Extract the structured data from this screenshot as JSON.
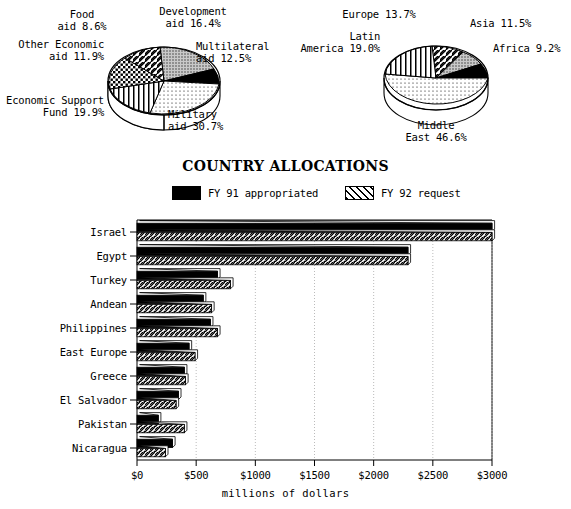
{
  "chart_data": [
    {
      "type": "pie",
      "id": "aid-by-category",
      "title": "",
      "labels": [
        "Development aid",
        "Multilateral aid",
        "Military aid",
        "Economic Support Fund",
        "Other Economic aid",
        "Food aid"
      ],
      "values": [
        16.4,
        12.5,
        30.7,
        19.9,
        11.9,
        8.6
      ],
      "value_suffix": "%",
      "patterns": [
        "gray-dots",
        "black",
        "light-dots",
        "vertical-lines",
        "checker",
        "diagonal"
      ],
      "annotations": [
        {
          "text": "Development\naid 16.4%"
        },
        {
          "text": "Multilateral\naid 12.5%"
        },
        {
          "text": "Military\naid 30.7%"
        },
        {
          "text": "Economic Support\nFund 19.9%"
        },
        {
          "text": "Other Economic\naid 11.9%"
        },
        {
          "text": "Food\naid 8.6%"
        }
      ]
    },
    {
      "type": "pie",
      "id": "aid-by-region",
      "title": "",
      "labels": [
        "Europe",
        "Asia",
        "Africa",
        "Middle East",
        "Latin America"
      ],
      "values": [
        13.7,
        11.5,
        9.2,
        46.6,
        19.0
      ],
      "value_suffix": "%",
      "patterns": [
        "diagonal",
        "gray-dots",
        "black",
        "light-dots",
        "vertical-lines"
      ],
      "annotations": [
        {
          "text": "Europe 13.7%"
        },
        {
          "text": "Asia 11.5%"
        },
        {
          "text": "Africa 9.2%"
        },
        {
          "text": "Middle\nEast 46.6%"
        },
        {
          "text": "Latin\nAmerica 19.0%"
        }
      ]
    },
    {
      "type": "bar",
      "id": "country-allocations",
      "orientation": "horizontal",
      "title": "COUNTRY ALLOCATIONS",
      "xlabel": "millions of dollars",
      "ylabel": "",
      "xlim": [
        0,
        3000
      ],
      "xticks": [
        0,
        500,
        1000,
        1500,
        2000,
        2500,
        3000
      ],
      "xtick_labels": [
        "$0",
        "$500",
        "$1000",
        "$1500",
        "$2000",
        "$2500",
        "$3000"
      ],
      "grid": true,
      "legend_position": "top",
      "categories": [
        "Israel",
        "Egypt",
        "Turkey",
        "Andean",
        "Philippines",
        "East Europe",
        "Greece",
        "El Salvador",
        "Pakistan",
        "Nicaragua"
      ],
      "series": [
        {
          "name": "FY 91 appropriated",
          "pattern": "black",
          "values": [
            3000,
            2290,
            680,
            560,
            620,
            440,
            400,
            350,
            180,
            300
          ]
        },
        {
          "name": "FY 92 request",
          "pattern": "diagonal",
          "values": [
            3000,
            2290,
            790,
            630,
            680,
            490,
            410,
            330,
            400,
            240
          ]
        }
      ]
    }
  ],
  "pie_left": {
    "labels": {
      "food": "Food\naid 8.6%",
      "development": "Development\naid 16.4%",
      "other_economic": "Other Economic\naid 11.9%",
      "multilateral": "Multilateral\naid 12.5%",
      "esf": "Economic Support\nFund 19.9%",
      "military": "Military\naid 30.7%"
    }
  },
  "pie_right": {
    "labels": {
      "europe": "Europe 13.7%",
      "asia": "Asia 11.5%",
      "latin_america": "Latin\nAmerica 19.0%",
      "africa": "Africa 9.2%",
      "middle_east": "Middle\nEast 46.6%"
    }
  },
  "bar_chart": {
    "title": "COUNTRY ALLOCATIONS",
    "xlabel": "millions of dollars",
    "legend": [
      {
        "label": "FY 91 appropriated",
        "pattern": "black"
      },
      {
        "label": "FY 92 request",
        "pattern": "diagonal"
      }
    ]
  },
  "colors": {
    "ink": "#000000",
    "paper": "#ffffff",
    "gray_fill": "#9a9a9a",
    "grid": "#bbbbbb"
  }
}
